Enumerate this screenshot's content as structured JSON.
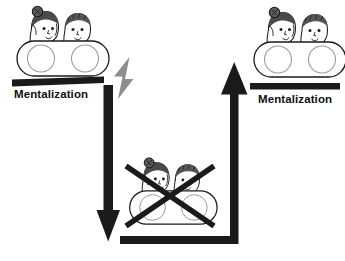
{
  "diagram": {
    "type": "flow-diagram",
    "background_color": "#ffffff",
    "ink_color": "#1a1a1a",
    "accent_gray": "#8d8d8d"
  },
  "nodes": {
    "intact_left": {
      "name": "Intact mentalizing dyad (left)",
      "label": "Mentalization",
      "state": "present",
      "crossed_out": false,
      "figures": [
        "female-figure",
        "male-figure"
      ],
      "bar_color": "#1a1a1a"
    },
    "broken_bottom": {
      "name": "Mentalizing failure (bottom)",
      "label": "",
      "state": "absent",
      "crossed_out": true,
      "figures": [
        "female-figure",
        "male-figure"
      ],
      "cross_color": "#1a1a1a"
    },
    "intact_right": {
      "name": "Restored mentalizing dyad (right)",
      "label": "Mentalization",
      "state": "restored",
      "crossed_out": false,
      "figures": [
        "female-figure",
        "male-figure"
      ],
      "bar_color": "#1a1a1a"
    }
  },
  "connectors": {
    "stressor": {
      "name": "lightning-bolt",
      "icon": "lightning-bolt-icon",
      "color": "#8d8d8d",
      "meaning": "stress / arousal trigger"
    },
    "down_arrow": {
      "name": "breakdown-arrow",
      "icon": "arrow-down-icon",
      "direction": "down",
      "color": "#1a1a1a"
    },
    "return_path": {
      "name": "recovery-path",
      "icon": "elbow-connector-icon",
      "direction": "right-then-up",
      "color": "#1a1a1a"
    },
    "up_arrow": {
      "name": "recovery-arrow",
      "icon": "arrow-up-icon",
      "direction": "up",
      "color": "#1a1a1a"
    }
  }
}
